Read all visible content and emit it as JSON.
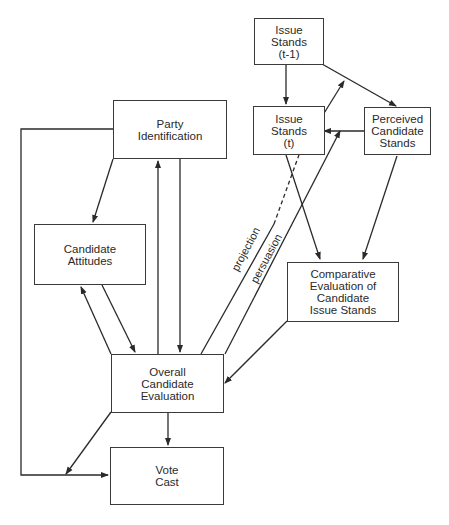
{
  "diagram": {
    "nodes": {
      "issue_stands_prev": {
        "label": "Issue\nStands\n(t-1)"
      },
      "issue_stands_t": {
        "label": "Issue\nStands\n(t)"
      },
      "perceived_candidate_stands": {
        "label": "Perceived\nCandidate\nStands"
      },
      "party_identification": {
        "label": "Party\nIdentification"
      },
      "candidate_attitudes": {
        "label": "Candidate\nAttitudes"
      },
      "comparative_evaluation": {
        "label": "Comparative\nEvaluation of\nCandidate\nIssue Stands"
      },
      "overall_candidate_evaluation": {
        "label": "Overall\nCandidate\nEvaluation"
      },
      "vote_cast": {
        "label": "Vote\nCast"
      }
    },
    "edge_labels": {
      "projection": "projection",
      "persuasion": "persuasion"
    },
    "edges": [
      {
        "from": "Issue Stands (t-1)",
        "to": "Issue Stands (t)"
      },
      {
        "from": "Issue Stands (t-1)",
        "to": "Perceived Candidate Stands"
      },
      {
        "from": "Perceived Candidate Stands",
        "to": "Issue Stands (t)"
      },
      {
        "from": "Issue Stands (t)",
        "to": "Comparative Evaluation of Candidate Issue Stands"
      },
      {
        "from": "Perceived Candidate Stands",
        "to": "Comparative Evaluation of Candidate Issue Stands"
      },
      {
        "from": "Overall Candidate Evaluation",
        "to": "Issue Stands (t-1)/(t)",
        "label": "projection"
      },
      {
        "from": "Overall Candidate Evaluation",
        "to": "Perceived Candidate Stands",
        "label": "persuasion"
      },
      {
        "from": "Comparative Evaluation of Candidate Issue Stands",
        "to": "Overall Candidate Evaluation"
      },
      {
        "from": "Party Identification",
        "to": "Candidate Attitudes"
      },
      {
        "from": "Party Identification",
        "to": "Overall Candidate Evaluation"
      },
      {
        "from": "Overall Candidate Evaluation",
        "to": "Party Identification"
      },
      {
        "from": "Candidate Attitudes",
        "to": "Overall Candidate Evaluation"
      },
      {
        "from": "Overall Candidate Evaluation",
        "to": "Candidate Attitudes"
      },
      {
        "from": "Party Identification",
        "to": "Vote Cast"
      },
      {
        "from": "Overall Candidate Evaluation",
        "to": "Vote Cast"
      }
    ]
  }
}
